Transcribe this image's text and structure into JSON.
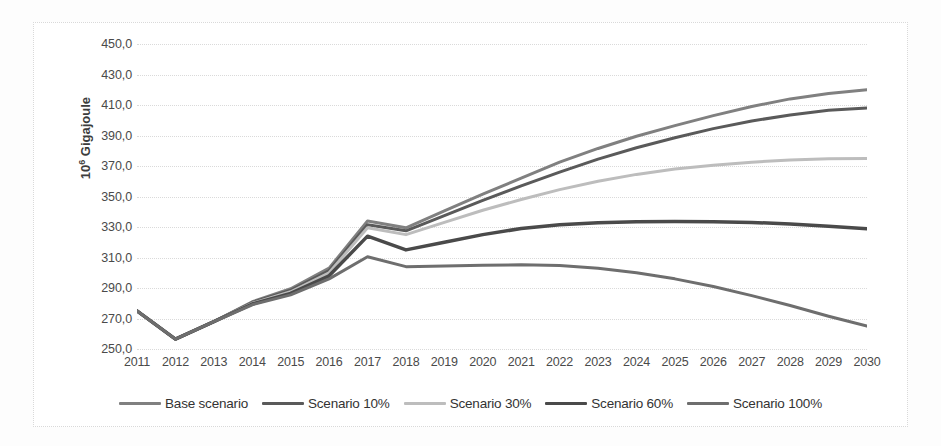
{
  "chart_data": {
    "type": "line",
    "title": "",
    "xlabel": "",
    "ylabel": "10⁶ Gigajoule",
    "ylabel_prefix": "10",
    "ylabel_exponent": "6",
    "ylabel_unit": "Gigajoule",
    "x": [
      2011,
      2012,
      2013,
      2014,
      2015,
      2016,
      2017,
      2018,
      2019,
      2020,
      2021,
      2022,
      2023,
      2024,
      2025,
      2026,
      2027,
      2028,
      2029,
      2030
    ],
    "xticklabels": [
      "2011",
      "2012",
      "2013",
      "2014",
      "2015",
      "2016",
      "2017",
      "2018",
      "2019",
      "2020",
      "2021",
      "2022",
      "2023",
      "2024",
      "2025",
      "2026",
      "2027",
      "2028",
      "2029",
      "2030"
    ],
    "yticks": [
      250,
      270,
      290,
      310,
      330,
      350,
      370,
      390,
      410,
      430,
      450
    ],
    "yticklabels": [
      "250,0",
      "270,0",
      "290,0",
      "310,0",
      "330,0",
      "350,0",
      "370,0",
      "390,0",
      "410,0",
      "430,0",
      "450,0"
    ],
    "ylim": [
      250,
      450
    ],
    "xlim": [
      2011,
      2030
    ],
    "grid": true,
    "grid_axis": "y",
    "legend_position": "bottom",
    "series": [
      {
        "name": "Base scenario",
        "color": "#808080",
        "width": 3,
        "values": [
          275.0,
          256.5,
          268.0,
          281.0,
          289.5,
          303.0,
          334.0,
          329.5,
          340.5,
          351.5,
          362.0,
          372.5,
          381.5,
          389.5,
          396.5,
          403.0,
          409.0,
          414.0,
          417.5,
          420.0
        ]
      },
      {
        "name": "Scenario 10%",
        "color": "#5a5a5a",
        "width": 3,
        "values": [
          275.0,
          256.5,
          268.0,
          280.5,
          288.5,
          301.5,
          331.5,
          327.5,
          337.5,
          347.5,
          357.0,
          366.0,
          374.5,
          382.0,
          388.5,
          394.5,
          399.5,
          403.5,
          406.5,
          408.0
        ]
      },
      {
        "name": "Scenario 30%",
        "color": "#bdbdbd",
        "width": 3,
        "values": [
          275.0,
          256.5,
          268.0,
          280.0,
          287.5,
          300.0,
          329.5,
          325.0,
          333.0,
          341.0,
          348.0,
          354.5,
          360.0,
          364.5,
          368.0,
          370.5,
          372.5,
          374.0,
          374.8,
          375.0
        ]
      },
      {
        "name": "Scenario 60%",
        "color": "#4a4a4a",
        "width": 3.5,
        "values": [
          275.0,
          256.5,
          268.0,
          279.5,
          286.5,
          298.0,
          324.0,
          315.0,
          320.0,
          325.0,
          329.0,
          331.5,
          332.8,
          333.4,
          333.6,
          333.5,
          333.0,
          332.0,
          330.5,
          328.8
        ]
      },
      {
        "name": "Scenario 100%",
        "color": "#6e6e6e",
        "width": 3,
        "values": [
          275.0,
          256.5,
          268.0,
          279.0,
          285.5,
          296.0,
          310.5,
          304.0,
          304.5,
          305.0,
          305.2,
          304.8,
          303.0,
          300.0,
          296.0,
          291.0,
          285.0,
          278.5,
          271.5,
          265.0
        ]
      }
    ]
  },
  "legend": {
    "items": [
      {
        "label": "Base scenario",
        "color": "#808080"
      },
      {
        "label": "Scenario 10%",
        "color": "#5a5a5a"
      },
      {
        "label": "Scenario 30%",
        "color": "#bdbdbd"
      },
      {
        "label": "Scenario 60%",
        "color": "#4a4a4a"
      },
      {
        "label": "Scenario 100%",
        "color": "#6e6e6e"
      }
    ]
  }
}
